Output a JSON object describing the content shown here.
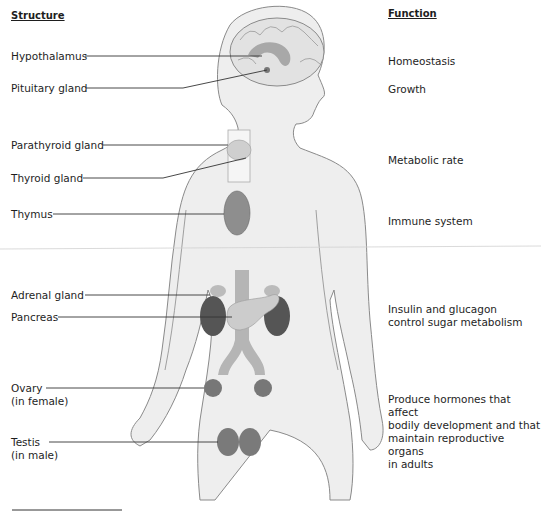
{
  "headers": {
    "structure": "Structure",
    "function": "Function"
  },
  "structures": [
    {
      "label": "Hypothalamus",
      "sub": ""
    },
    {
      "label": "Pituitary gland",
      "sub": ""
    },
    {
      "label": "Parathyroid gland",
      "sub": ""
    },
    {
      "label": "Thyroid gland",
      "sub": ""
    },
    {
      "label": "Thymus",
      "sub": ""
    },
    {
      "label": "Adrenal gland",
      "sub": ""
    },
    {
      "label": "Pancreas",
      "sub": ""
    },
    {
      "label": "Ovary",
      "sub": "(in female)"
    },
    {
      "label": "Testis",
      "sub": "(in male)"
    }
  ],
  "functions": [
    {
      "lines": [
        "Homeostasis"
      ]
    },
    {
      "lines": [
        "Growth"
      ]
    },
    {
      "lines": [
        "Metabolic rate"
      ]
    },
    {
      "lines": [
        "Immune system"
      ]
    },
    {
      "lines": [
        "Insulin and glucagon",
        "control sugar metabolism"
      ]
    },
    {
      "lines": [
        "Produce hormones that affect",
        "bodily development and that",
        "maintain reproductive organs",
        "in adults"
      ]
    }
  ],
  "colors": {
    "skin": "#eeeeee",
    "outline": "#8a8a8a",
    "organ_dark": "#555555",
    "organ_mid": "#9a9a9a",
    "vessel": "#b5b5b5",
    "leader_line": "#333333"
  }
}
